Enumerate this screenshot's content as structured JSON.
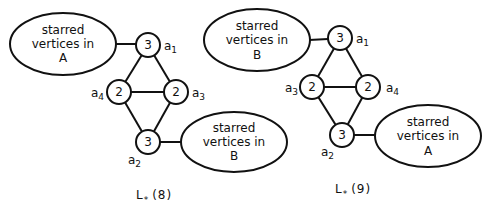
{
  "figure": {
    "left": {
      "caption": {
        "main": "L",
        "sub": "*",
        "arg": "(8)"
      },
      "ellipse_top": {
        "line1": "starred",
        "line2": "vertices in",
        "line3": "A"
      },
      "ellipse_bottom": {
        "line1": "starred",
        "line2": "vertices in",
        "line3": "B"
      },
      "nodes": [
        {
          "id": "a1",
          "weight": "3",
          "label": "a",
          "sub": "1"
        },
        {
          "id": "a4",
          "weight": "2",
          "label": "a",
          "sub": "4"
        },
        {
          "id": "a3",
          "weight": "2",
          "label": "a",
          "sub": "3"
        },
        {
          "id": "a2",
          "weight": "3",
          "label": "a",
          "sub": "2"
        }
      ]
    },
    "right": {
      "caption": {
        "main": "L",
        "sub": "*",
        "arg": "(9)"
      },
      "ellipse_top": {
        "line1": "starred",
        "line2": "vertices in",
        "line3": "B"
      },
      "ellipse_bottom": {
        "line1": "starred",
        "line2": "vertices in",
        "line3": "A"
      },
      "nodes": [
        {
          "id": "a1",
          "weight": "3",
          "label": "a",
          "sub": "1"
        },
        {
          "id": "a3",
          "weight": "2",
          "label": "a",
          "sub": "3"
        },
        {
          "id": "a4",
          "weight": "2",
          "label": "a",
          "sub": "4"
        },
        {
          "id": "a2",
          "weight": "3",
          "label": "a",
          "sub": "2"
        }
      ]
    }
  }
}
